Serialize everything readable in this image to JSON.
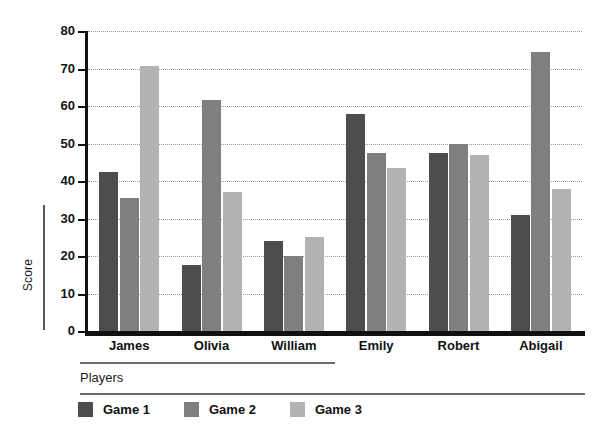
{
  "chart_data": {
    "type": "bar",
    "title": "",
    "xlabel": "Players",
    "ylabel": "Score",
    "ylim": [
      0,
      80
    ],
    "yticks": [
      0,
      10,
      20,
      30,
      40,
      50,
      60,
      70,
      80
    ],
    "grid": true,
    "legend_position": "bottom-left",
    "categories": [
      "James",
      "Olivia",
      "William",
      "Emily",
      "Robert",
      "Abigail"
    ],
    "series": [
      {
        "name": "Game 1",
        "color": "#4d4d4d",
        "values": [
          42.5,
          17.5,
          24,
          58,
          47.5,
          31
        ]
      },
      {
        "name": "Game 2",
        "color": "#7f7f7f",
        "values": [
          35.5,
          61.5,
          20,
          47.5,
          50,
          74.5
        ]
      },
      {
        "name": "Game 3",
        "color": "#b3b3b3",
        "values": [
          70.8,
          37,
          25,
          43.5,
          47,
          38
        ]
      }
    ]
  },
  "axis": {
    "y_label": "Score",
    "x_label": "Players",
    "y_ticks": [
      "0",
      "10",
      "20",
      "30",
      "40",
      "50",
      "60",
      "70",
      "80"
    ]
  },
  "legend": {
    "items": [
      {
        "label": "Game 1"
      },
      {
        "label": "Game 2"
      },
      {
        "label": "Game 3"
      }
    ]
  },
  "categories": [
    "James",
    "Olivia",
    "William",
    "Emily",
    "Robert",
    "Abigail"
  ]
}
